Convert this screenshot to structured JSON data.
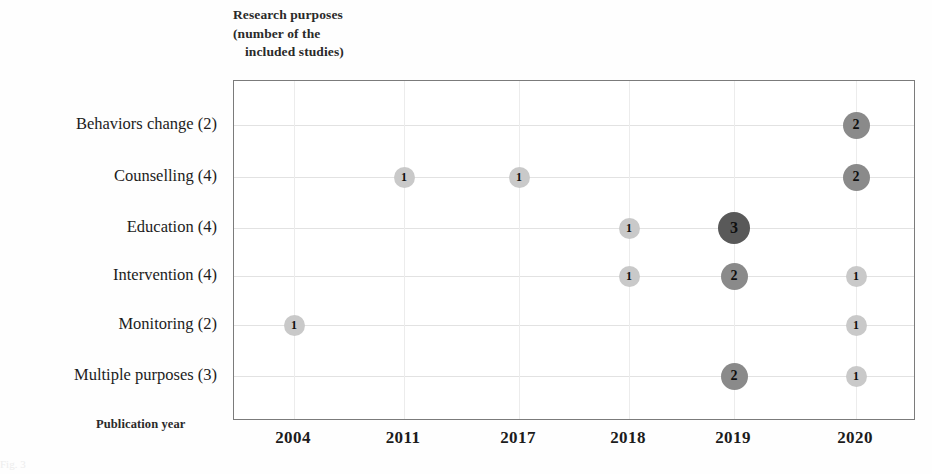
{
  "figure": {
    "y_axis_caption_lines": [
      "Research purposes",
      "(number of the",
      "included studies)"
    ],
    "x_axis_title": "Publication year",
    "faint_caption": "Fig. 3"
  },
  "style": {
    "bubble_color_1": "#c9c9c9",
    "bubble_color_2": "#8a8a8a",
    "bubble_color_3": "#595959",
    "frame_color": "#7b7b7b",
    "gridline_color": "#e2e2e2",
    "background": "#fefefe"
  },
  "chart_data": {
    "type": "scatter",
    "xlabel": "Publication year",
    "ylabel": "Research purposes (number of the included studies)",
    "grid": true,
    "legend": "none",
    "categories": [
      "Behaviors change (2)",
      "Counselling (4)",
      "Education (4)",
      "Intervention (4)",
      "Monitoring (2)",
      "Multiple purposes (3)"
    ],
    "x": [
      "2004",
      "2011",
      "2017",
      "2018",
      "2019",
      "2020"
    ],
    "matrix": [
      [
        null,
        null,
        null,
        null,
        null,
        2
      ],
      [
        null,
        1,
        1,
        null,
        null,
        2
      ],
      [
        null,
        null,
        null,
        1,
        3,
        null
      ],
      [
        null,
        null,
        null,
        1,
        2,
        1
      ],
      [
        1,
        null,
        null,
        null,
        null,
        1
      ],
      [
        null,
        null,
        null,
        null,
        2,
        1
      ]
    ],
    "points": [
      {
        "category": "Behaviors change (2)",
        "year": "2020",
        "value": 2
      },
      {
        "category": "Counselling (4)",
        "year": "2011",
        "value": 1
      },
      {
        "category": "Counselling (4)",
        "year": "2017",
        "value": 1
      },
      {
        "category": "Counselling (4)",
        "year": "2020",
        "value": 2
      },
      {
        "category": "Education (4)",
        "year": "2018",
        "value": 1
      },
      {
        "category": "Education (4)",
        "year": "2019",
        "value": 3
      },
      {
        "category": "Intervention (4)",
        "year": "2018",
        "value": 1
      },
      {
        "category": "Intervention (4)",
        "year": "2019",
        "value": 2
      },
      {
        "category": "Intervention (4)",
        "year": "2020",
        "value": 1
      },
      {
        "category": "Monitoring (2)",
        "year": "2004",
        "value": 1
      },
      {
        "category": "Monitoring (2)",
        "year": "2020",
        "value": 1
      },
      {
        "category": "Multiple purposes (3)",
        "year": "2019",
        "value": 2
      },
      {
        "category": "Multiple purposes (3)",
        "year": "2020",
        "value": 1
      }
    ]
  },
  "geometry": {
    "row_y": [
      124,
      176,
      227,
      275,
      324,
      375
    ],
    "col_x": [
      293,
      403,
      518,
      628,
      733,
      855
    ],
    "plot_left": 233,
    "plot_top": 80,
    "plot_width": 682,
    "plot_height": 340,
    "bubble_size_1": 21,
    "bubble_size_2": 27,
    "bubble_size_3": 32,
    "bubble_font_1": 12,
    "bubble_font_2": 14,
    "bubble_font_3": 16
  }
}
